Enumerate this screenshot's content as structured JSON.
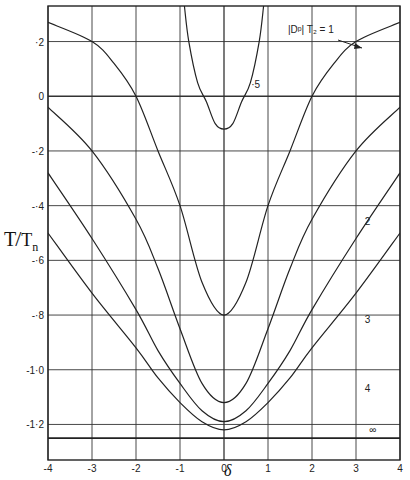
{
  "chart_data": {
    "type": "line",
    "title": "",
    "xlabel": "δ",
    "ylabel": "T/Tn",
    "xlim": [
      -4,
      4
    ],
    "ylim": [
      -1.33,
      0.33
    ],
    "grid": true,
    "x_ticks": [
      -4,
      -3,
      -2,
      -1,
      0,
      1,
      2,
      3,
      4
    ],
    "x_tick_labels": [
      "-4",
      "-3",
      "-2",
      "-1",
      "0",
      "1",
      "2",
      "3",
      "4"
    ],
    "y_ticks": [
      0.2,
      0,
      -0.2,
      -0.4,
      -0.6,
      -0.8,
      -1.0,
      -1.2
    ],
    "y_tick_labels": [
      "·2",
      "0",
      "-·2",
      "-·4",
      "-·6",
      "-·8",
      "-1·0",
      "-1·2"
    ],
    "legend_annotation": "|Dᵖ|  T₂ = 1",
    "series": [
      {
        "name": "·5",
        "label": "·5",
        "x": [
          -0.9,
          -0.8,
          -0.6,
          -0.4,
          -0.2,
          0,
          0.2,
          0.4,
          0.6,
          0.8,
          0.9
        ],
        "y": [
          0.33,
          0.2,
          0.05,
          -0.02,
          -0.1,
          -0.12,
          -0.1,
          -0.02,
          0.05,
          0.2,
          0.33
        ]
      },
      {
        "name": "1",
        "label": "|Dᵖ| T₂ = 1",
        "x": [
          -4,
          -3,
          -2.5,
          -2,
          -1.5,
          -1,
          -0.5,
          0,
          0.5,
          1,
          1.5,
          2,
          2.5,
          3,
          4
        ],
        "y": [
          0.27,
          0.2,
          0.12,
          0.0,
          -0.2,
          -0.4,
          -0.68,
          -0.8,
          -0.68,
          -0.4,
          -0.2,
          0.0,
          0.12,
          0.2,
          0.27
        ]
      },
      {
        "name": "2",
        "label": "2",
        "x": [
          -4,
          -3,
          -2,
          -1.5,
          -1,
          -0.5,
          0,
          0.5,
          1,
          1.5,
          2,
          3,
          4
        ],
        "y": [
          -0.04,
          -0.2,
          -0.45,
          -0.63,
          -0.85,
          -1.05,
          -1.12,
          -1.05,
          -0.85,
          -0.63,
          -0.45,
          -0.2,
          -0.04
        ]
      },
      {
        "name": "3",
        "label": "3",
        "x": [
          -4,
          -3,
          -2,
          -1.5,
          -1,
          -0.5,
          0,
          0.5,
          1,
          1.5,
          2,
          3,
          4
        ],
        "y": [
          -0.28,
          -0.52,
          -0.78,
          -0.93,
          -1.05,
          -1.15,
          -1.19,
          -1.15,
          -1.05,
          -0.93,
          -0.78,
          -0.52,
          -0.28
        ]
      },
      {
        "name": "4",
        "label": "4",
        "x": [
          -4,
          -3,
          -2,
          -1.5,
          -1,
          -0.5,
          0,
          0.5,
          1,
          1.5,
          2,
          3,
          4
        ],
        "y": [
          -0.5,
          -0.72,
          -0.92,
          -1.03,
          -1.12,
          -1.19,
          -1.22,
          -1.19,
          -1.12,
          -1.03,
          -0.92,
          -0.72,
          -0.5
        ]
      },
      {
        "name": "∞",
        "label": "∞",
        "x": [
          -4,
          4
        ],
        "y": [
          -1.25,
          -1.25
        ]
      }
    ],
    "annotations": [
      {
        "text": "·5",
        "x": 0.62,
        "y": 0.03
      },
      {
        "text": "2",
        "x": 3.2,
        "y": -0.47
      },
      {
        "text": "3",
        "x": 3.2,
        "y": -0.83
      },
      {
        "text": "4",
        "x": 3.2,
        "y": -1.08
      },
      {
        "text": "∞",
        "x": 3.3,
        "y": -1.23
      }
    ]
  },
  "labels": {
    "y_axis_title": "T/Tn",
    "x_axis_title": "δ",
    "annotation_main": "|Dᵖ|  T₂ = 1"
  }
}
